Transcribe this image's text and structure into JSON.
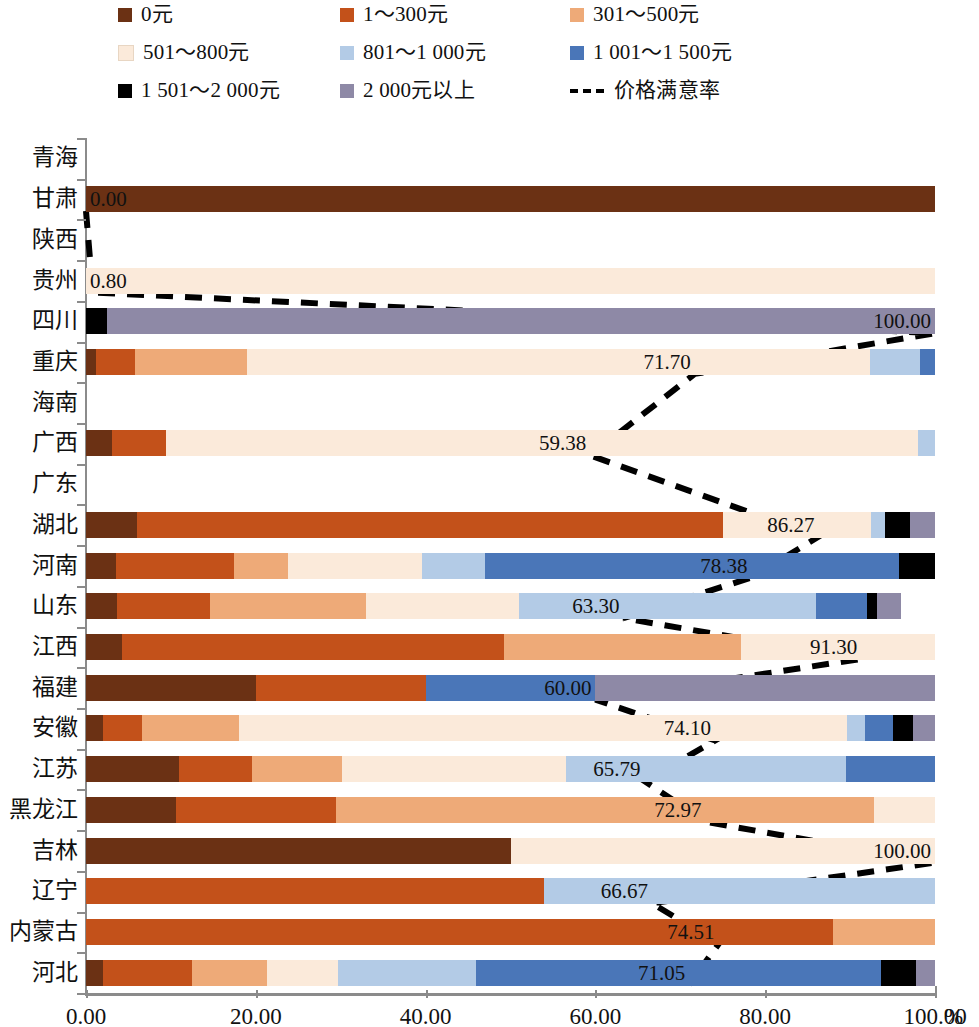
{
  "legend": {
    "items": [
      {
        "label": "0元",
        "color": "#6b3114",
        "type": "swatch"
      },
      {
        "label": "1～300元",
        "color": "#c3511a",
        "type": "swatch"
      },
      {
        "label": "301～500元",
        "color": "#eeaa78",
        "type": "swatch"
      },
      {
        "label": "501～800元",
        "color": "#fbeada",
        "type": "swatch"
      },
      {
        "label": "801～1 000元",
        "color": "#b3cbe6",
        "type": "swatch"
      },
      {
        "label": "1 001～1 500元",
        "color": "#4a76b8",
        "type": "swatch"
      },
      {
        "label": "1 501～2 000元",
        "color": "#000000",
        "type": "swatch"
      },
      {
        "label": "2 000元以上",
        "color": "#8e89a6",
        "type": "swatch"
      },
      {
        "label": "价格满意率",
        "color": "#000000",
        "type": "dashed-line"
      }
    ]
  },
  "axis": {
    "x_ticks": [
      "0.00",
      "20.00",
      "40.00",
      "60.00",
      "80.00",
      "100.00"
    ],
    "x_unit": "%",
    "x_min": 0,
    "x_max": 100
  },
  "chart_data": {
    "type": "bar",
    "orientation": "horizontal",
    "stacked": true,
    "title": "",
    "xlabel": "%",
    "ylabel": "",
    "xlim": [
      0,
      100
    ],
    "grid": false,
    "legend_position": "top",
    "categories": [
      "青海",
      "甘肃",
      "陕西",
      "贵州",
      "四川",
      "重庆",
      "海南",
      "广西",
      "广东",
      "湖北",
      "河南",
      "山东",
      "江西",
      "福建",
      "安徽",
      "江苏",
      "黑龙江",
      "吉林",
      "辽宁",
      "内蒙古",
      "河北"
    ],
    "series": [
      {
        "name": "0元",
        "color": "#6b3114",
        "values": [
          0,
          100,
          0,
          0,
          0,
          1.2,
          0,
          3.1,
          0,
          6.0,
          3.5,
          3.6,
          4.2,
          20.0,
          2.0,
          11.0,
          10.6,
          50.0,
          0,
          0,
          2.0
        ]
      },
      {
        "name": "1～300元",
        "color": "#c3511a",
        "values": [
          0,
          0,
          0,
          0,
          0,
          4.6,
          0,
          6.3,
          0,
          69.0,
          13.9,
          11.0,
          45.0,
          20.0,
          4.6,
          8.6,
          18.9,
          0,
          54.0,
          88.0,
          10.5
        ]
      },
      {
        "name": "301～500元",
        "color": "#eeaa78",
        "values": [
          0,
          0,
          0,
          0,
          0,
          13.2,
          0,
          0,
          0,
          0,
          6.4,
          18.4,
          28.0,
          0,
          11.4,
          10.6,
          63.3,
          0,
          0,
          12.0,
          8.8
        ]
      },
      {
        "name": "501～800元",
        "color": "#fbeada",
        "values": [
          0,
          0,
          0,
          100,
          0,
          73.3,
          0,
          88.6,
          0,
          17.5,
          15.8,
          18.0,
          22.8,
          0,
          71.6,
          26.3,
          7.2,
          50.0,
          0,
          0,
          8.4
        ]
      },
      {
        "name": "801～1 000元",
        "color": "#b3cbe6",
        "values": [
          0,
          0,
          0,
          0,
          0,
          5.9,
          0,
          2.0,
          0,
          1.6,
          7.4,
          35.0,
          0,
          0,
          2.2,
          33.0,
          0,
          0,
          46.0,
          0,
          16.2
        ]
      },
      {
        "name": "1 001～1 500元",
        "color": "#4a76b8",
        "values": [
          0,
          0,
          0,
          0,
          0,
          1.8,
          0,
          0,
          0,
          0,
          48.8,
          6.0,
          0,
          20.0,
          3.2,
          10.5,
          0,
          0,
          0,
          0,
          47.8
        ]
      },
      {
        "name": "1 501～2 000元",
        "color": "#000000",
        "values": [
          0,
          0,
          0,
          0,
          2.5,
          0,
          0,
          0,
          0,
          3.0,
          4.2,
          1.2,
          0,
          0,
          2.4,
          0,
          0,
          0,
          0,
          0,
          4.1
        ]
      },
      {
        "name": "2 000元以上",
        "color": "#8e89a6",
        "values": [
          0,
          0,
          0,
          0,
          97.5,
          0,
          0,
          0,
          0,
          2.9,
          0,
          2.8,
          0,
          40.0,
          2.6,
          0,
          0,
          0,
          0,
          0,
          2.2
        ]
      }
    ],
    "satisfaction": {
      "name": "价格满意率",
      "style": "dashed",
      "color": "#000000",
      "values": [
        null,
        0.0,
        null,
        0.8,
        100.0,
        71.7,
        null,
        59.38,
        null,
        86.27,
        78.38,
        63.3,
        91.3,
        60.0,
        74.1,
        65.79,
        72.97,
        100.0,
        66.67,
        74.51,
        71.05
      ],
      "labels": [
        {
          "category": "甘肃",
          "text": "0.00",
          "value": 0.0
        },
        {
          "category": "贵州",
          "text": "0.80",
          "value": 0.8
        },
        {
          "category": "四川",
          "text": "100.00",
          "value": 100.0
        },
        {
          "category": "重庆",
          "text": "71.70",
          "value": 71.7
        },
        {
          "category": "广西",
          "text": "59.38",
          "value": 59.38
        },
        {
          "category": "湖北",
          "text": "86.27",
          "value": 86.27
        },
        {
          "category": "河南",
          "text": "78.38",
          "value": 78.38
        },
        {
          "category": "山东",
          "text": "63.30",
          "value": 63.3
        },
        {
          "category": "江西",
          "text": "91.30",
          "value": 91.3
        },
        {
          "category": "福建",
          "text": "60.00",
          "value": 60.0
        },
        {
          "category": "安徽",
          "text": "74.10",
          "value": 74.1
        },
        {
          "category": "江苏",
          "text": "65.79",
          "value": 65.79
        },
        {
          "category": "黑龙江",
          "text": "72.97",
          "value": 72.97
        },
        {
          "category": "吉林",
          "text": "100.00",
          "value": 100.0
        },
        {
          "category": "辽宁",
          "text": "66.67",
          "value": 66.67
        },
        {
          "category": "内蒙古",
          "text": "74.51",
          "value": 74.51
        },
        {
          "category": "河北",
          "text": "71.05",
          "value": 71.05
        }
      ]
    }
  }
}
